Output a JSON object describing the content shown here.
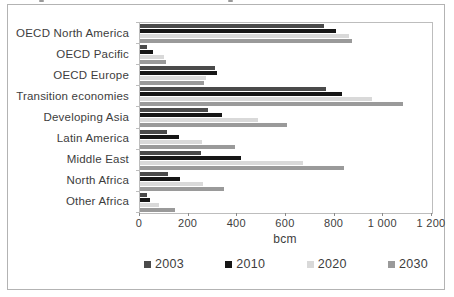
{
  "chart_data": {
    "type": "bar",
    "orientation": "horizontal",
    "title": "",
    "xlabel": "bcm",
    "ylabel": "",
    "unit": "bcm",
    "xlim": [
      0,
      1200
    ],
    "grid": false,
    "legend_position": "bottom",
    "categories": [
      "OECD North America",
      "OECD Pacific",
      "OECD Europe",
      "Transition economies",
      "Developing Asia",
      "Latin America",
      "Middle East",
      "North Africa",
      "Other Africa"
    ],
    "series": [
      {
        "name": "2003",
        "color": "#4a4a4a",
        "values": [
          755,
          30,
          310,
          765,
          280,
          110,
          250,
          115,
          30
        ]
      },
      {
        "name": "2010",
        "color": "#161616",
        "values": [
          805,
          55,
          315,
          830,
          335,
          160,
          415,
          165,
          40
        ]
      },
      {
        "name": "2020",
        "color": "#d9d9d9",
        "values": [
          860,
          100,
          270,
          955,
          485,
          255,
          670,
          260,
          80
        ]
      },
      {
        "name": "2030",
        "color": "#9a9a9a",
        "values": [
          870,
          105,
          265,
          1080,
          605,
          390,
          840,
          345,
          145
        ]
      }
    ],
    "xticks": [
      0,
      200,
      400,
      600,
      800,
      1000,
      1200
    ],
    "xtick_labels": [
      "0",
      "200",
      "400",
      "600",
      "800",
      "1 000",
      "1 200"
    ]
  },
  "colors": {
    "figure_border": "#b3b3b3",
    "plot_border": "#bdbdbd",
    "text": "#3d3d3d",
    "background": "#ffffff"
  }
}
